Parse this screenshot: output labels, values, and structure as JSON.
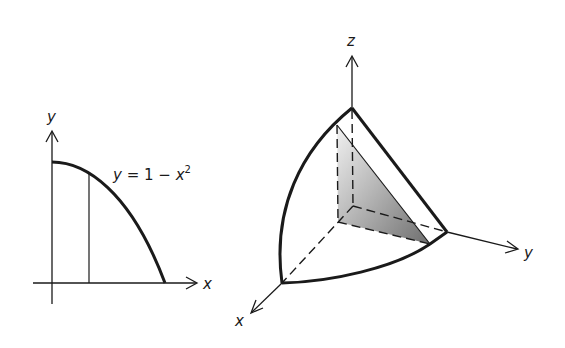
{
  "figure": {
    "left_panel": {
      "axis_labels": {
        "x": "x",
        "y": "y"
      },
      "curve_label": {
        "lhs": "y",
        "eq": " = 1 − ",
        "var": "x",
        "exp": "2"
      }
    },
    "right_panel": {
      "axis_labels": {
        "x": "x",
        "y": "y",
        "z": "z"
      }
    },
    "colors": {
      "ink": "#1a1a1a",
      "shade_dark": "#7a7a7a",
      "shade_light": "#e6e6e6",
      "background": "#ffffff"
    }
  }
}
